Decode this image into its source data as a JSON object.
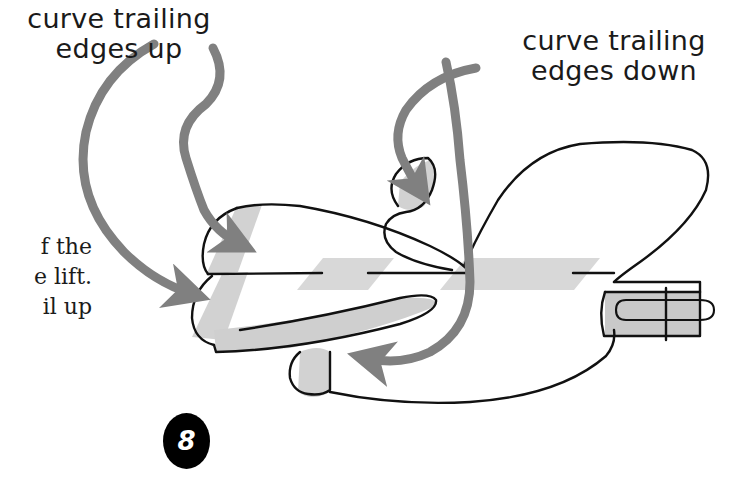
{
  "figure": {
    "step_number": "8",
    "background_color": "#ffffff",
    "ink_color": "#1a1a1a",
    "arrow_color": "#808080",
    "shade_color": "#d2d2d2",
    "band_color": "#d6d6d6"
  },
  "callouts": {
    "left": {
      "name": "curve-trailing-edges-up",
      "text": "curve trailing\nedges up",
      "line1": "curve trailing",
      "line2": "edges up"
    },
    "right": {
      "name": "curve-trailing-edges-down",
      "text": "curve trailing\nedges down",
      "line1": "curve trailing",
      "line2": "edges down"
    }
  },
  "body_text": {
    "clipped": true,
    "lines": [
      "f the",
      "e lift.",
      "il up"
    ],
    "text": "f the\ne lift.\nil up"
  },
  "arrows": [
    {
      "name": "arrow-up-outer",
      "from": "callout-left",
      "to": "lower-wing-trailing-edge",
      "direction": "down-right",
      "color": "#808080"
    },
    {
      "name": "arrow-up-inner",
      "from": "callout-left",
      "to": "upper-wing-trailing-edge",
      "direction": "down-right",
      "color": "#808080"
    },
    {
      "name": "arrow-down-outer",
      "from": "callout-right",
      "to": "lower-rear-fold",
      "direction": "down-left",
      "color": "#808080"
    },
    {
      "name": "arrow-down-inner",
      "from": "callout-right",
      "to": "upper-rear-fold",
      "direction": "down-left",
      "color": "#808080"
    }
  ],
  "plane_parts": [
    {
      "name": "fuselage-center-line"
    },
    {
      "name": "upper-wing"
    },
    {
      "name": "lower-wing"
    },
    {
      "name": "nose-fold-shade"
    },
    {
      "name": "tail-section"
    },
    {
      "name": "paper-clip"
    },
    {
      "name": "tape-band-left"
    },
    {
      "name": "tape-band-right"
    }
  ]
}
